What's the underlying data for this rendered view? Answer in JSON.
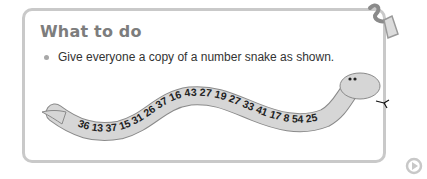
{
  "section": {
    "title": "What to do",
    "instructions": [
      "Give everyone a copy of a number snake as shown."
    ]
  },
  "number_snake": {
    "numbers": [
      36,
      13,
      37,
      15,
      31,
      26,
      37,
      16,
      43,
      27,
      19,
      27,
      33,
      41,
      17,
      8,
      54,
      25
    ],
    "body_color": "#d6d6d6",
    "outline_color": "#8a8a8a"
  },
  "icons": {
    "corner": "glue-tube-icon",
    "next": "play-next-icon"
  },
  "colors": {
    "panel_border": "#c9c9c9",
    "title": "#7d7d7d",
    "text": "#333333"
  }
}
